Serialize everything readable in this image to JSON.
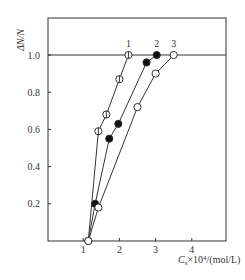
{
  "chart_data": {
    "type": "line",
    "title": "",
    "xlabel": "C_s×10^4/(mol/L)",
    "ylabel": "ΔN/N",
    "xlim": [
      0,
      4.9
    ],
    "ylim": [
      0,
      1.2
    ],
    "xticks": [
      "1",
      "2",
      "3",
      "4"
    ],
    "xtick_values": [
      1,
      2,
      3,
      4
    ],
    "yticks": [
      "0.2",
      "0.4",
      "0.6",
      "0.8",
      "1.0"
    ],
    "ytick_values": [
      0.2,
      0.4,
      0.6,
      0.8,
      1.0
    ],
    "grid": false,
    "reference_line": {
      "y": 1.0
    },
    "series": [
      {
        "name": "1",
        "marker": "open-circle-with-bar",
        "x": [
          1.14,
          1.42,
          1.64,
          2.0,
          2.25
        ],
        "y": [
          0.0,
          0.59,
          0.68,
          0.87,
          1.0
        ]
      },
      {
        "name": "2",
        "marker": "filled-circle",
        "x": [
          1.33,
          1.72,
          1.97,
          2.75,
          3.03
        ],
        "y": [
          0.2,
          0.55,
          0.63,
          0.96,
          1.0
        ]
      },
      {
        "name": "3",
        "marker": "open-circle",
        "x": [
          1.14,
          1.42,
          2.5,
          3.0,
          3.5
        ],
        "y": [
          0.0,
          0.18,
          0.72,
          0.9,
          1.0
        ]
      }
    ]
  },
  "labels": {
    "xlabel_main": "C",
    "xlabel_sub": "s",
    "xlabel_rest": "×10",
    "xlabel_sup": "4",
    "xlabel_unit": "/(mol/L)",
    "ylabel": "ΔN/N"
  }
}
